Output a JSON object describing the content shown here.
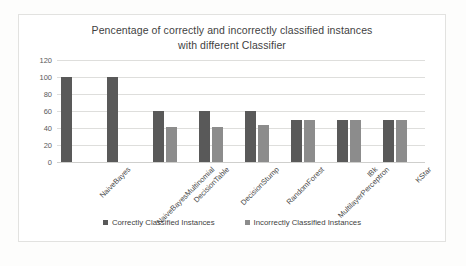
{
  "chart_data": {
    "type": "bar",
    "title": "Pencentage of correctly and incorrectly classified instances with different Classifier",
    "title_lines": [
      "Pencentage of correctly and incorrectly classified instances",
      "with different Classifier"
    ],
    "xlabel": "",
    "ylabel": "",
    "ylim": [
      0,
      120
    ],
    "yticks": [
      120,
      100,
      80,
      60,
      40,
      20,
      0
    ],
    "grid": true,
    "legend_position": "bottom",
    "categories": [
      "NaiveBayes",
      "NaiveBayesMultinomial",
      "DecisionTable",
      "DecisionStump",
      "RandomForest",
      "MultilayerPerceptron",
      "IBk",
      "KStar"
    ],
    "series": [
      {
        "name": "Correctly Classified Instances",
        "color": "#595959",
        "values": [
          100,
          100,
          60,
          60,
          60,
          50,
          50,
          50
        ]
      },
      {
        "name": "Incorrectly Classified Instances",
        "color": "#8c8c8c",
        "values": [
          0,
          0,
          41,
          41,
          43,
          50,
          50,
          50
        ]
      }
    ]
  },
  "colors": {
    "correct": "#595959",
    "incorrect": "#8c8c8c",
    "grid": "#dededc",
    "frame": "#e2e2e0",
    "text": "#3f3f3f"
  }
}
